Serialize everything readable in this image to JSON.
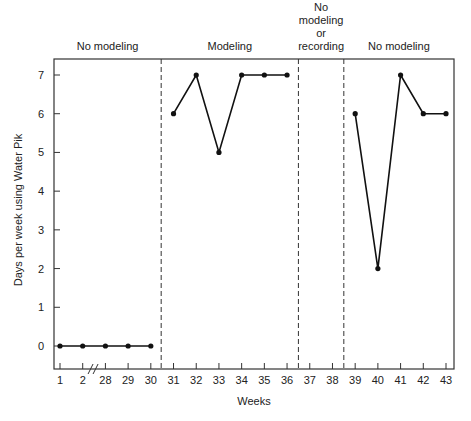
{
  "chart_data": {
    "type": "line",
    "title": "",
    "xlabel": "Weeks",
    "ylabel": "Days per week using Water Pik",
    "ylim": [
      0,
      7
    ],
    "yticks": [
      "0",
      "1",
      "2",
      "3",
      "4",
      "5",
      "6",
      "7"
    ],
    "x_categories": [
      "1",
      "2",
      "28",
      "29",
      "30",
      "31",
      "32",
      "33",
      "34",
      "35",
      "36",
      "37",
      "38",
      "39",
      "40",
      "41",
      "42",
      "43"
    ],
    "axis_break_between": [
      "2",
      "28"
    ],
    "grid": false,
    "legend": "none",
    "phases": [
      {
        "label": "No modeling",
        "start": "1",
        "end": "30"
      },
      {
        "label": "Modeling",
        "start": "31",
        "end": "36"
      },
      {
        "label": "No modeling or recording",
        "label_lines": [
          "No",
          "modeling",
          "or",
          "recording"
        ],
        "start": "37",
        "end": "38"
      },
      {
        "label": "No modeling",
        "start": "39",
        "end": "43"
      }
    ],
    "phase_dividers_after": [
      "30",
      "36",
      "38"
    ],
    "series": [
      {
        "name": "Baseline",
        "x": [
          "1",
          "2",
          "28",
          "29",
          "30"
        ],
        "values": [
          0,
          0,
          0,
          0,
          0
        ]
      },
      {
        "name": "Modeling",
        "x": [
          "31",
          "32",
          "33",
          "34",
          "35",
          "36"
        ],
        "values": [
          6,
          7,
          5,
          7,
          7,
          7
        ]
      },
      {
        "name": "Return to baseline",
        "x": [
          "39",
          "40",
          "41",
          "42",
          "43"
        ],
        "values": [
          6,
          2,
          7,
          6,
          6
        ]
      }
    ]
  }
}
